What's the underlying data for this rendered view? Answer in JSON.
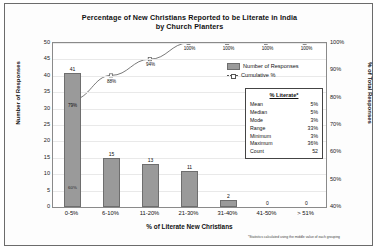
{
  "chart_data": {
    "type": "bar",
    "title": "Percentage of New Christians Reported to be Literate in India by Church Planters",
    "title_line1": "Percentage of New Christians Reported to be Literate in India",
    "title_line2": "by Church Planters",
    "xlabel": "% of Literate New Christians",
    "ylabel": "Number of Responses",
    "y2label": "% of Total Responses",
    "categories": [
      "0-5%",
      "6-10%",
      "11-20%",
      "21-30%",
      "31-40%",
      "41-50%",
      "> 51%"
    ],
    "series": [
      {
        "name": "Number of Responses",
        "type": "bar",
        "axis": "left",
        "values": [
          41,
          15,
          13,
          11,
          2,
          0,
          0
        ],
        "labels": [
          "41",
          "15",
          "13",
          "11",
          "2",
          "0",
          "0"
        ]
      },
      {
        "name": "Cumulative %",
        "type": "line",
        "axis": "right",
        "values": [
          79,
          88,
          94,
          100,
          100,
          100,
          100
        ],
        "labels": [
          "79%",
          "88%",
          "94%",
          "100%",
          "100%",
          "100%",
          "100%"
        ]
      }
    ],
    "bar_inner_labels": [
      "60%",
      "",
      "",
      "",
      "",
      "",
      ""
    ],
    "ylim": [
      0,
      50
    ],
    "yticks": [
      0,
      5,
      10,
      15,
      20,
      25,
      30,
      35,
      40,
      45,
      50
    ],
    "ytick_labels": [
      "0",
      "5",
      "10",
      "15",
      "20",
      "25",
      "30",
      "35",
      "40",
      "45",
      "50"
    ],
    "y2lim": [
      40,
      100
    ],
    "y2ticks": [
      40,
      50,
      60,
      70,
      80,
      90,
      100
    ],
    "y2tick_labels": [
      "40%",
      "50%",
      "60%",
      "70%",
      "80%",
      "90%",
      "100%"
    ],
    "grid": true,
    "legend_position": "inside-right",
    "colors": {
      "bar_fill": "#9a9a9a",
      "bar_border": "#6e6e6e",
      "line": "#555555",
      "grid": "#e9e9e9",
      "axis": "#8a8a8a"
    }
  },
  "legend": {
    "items": [
      {
        "label": "Number of Responses"
      },
      {
        "label": "Cumulative %"
      }
    ]
  },
  "stats": {
    "header": "% Literate*",
    "rows": [
      {
        "label": "Mean",
        "value": "5%"
      },
      {
        "label": "Median",
        "value": "5%"
      },
      {
        "label": "Mode",
        "value": "3%"
      },
      {
        "label": "Range",
        "value": "33%"
      },
      {
        "label": "Minimum",
        "value": "3%"
      },
      {
        "label": "Maximum",
        "value": "36%"
      },
      {
        "label": "Count",
        "value": "52"
      }
    ]
  },
  "footnote": "*Statistics calculated using the middle value of each grouping"
}
